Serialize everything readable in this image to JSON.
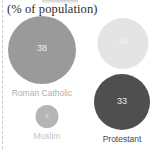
{
  "chart_data": {
    "type": "bar",
    "title": "",
    "subtitle": "(% of population)",
    "xlabel": "",
    "ylabel": "",
    "categories": [
      "Roman Catholic",
      "Other",
      "Protestant",
      "Muslim"
    ],
    "values": [
      38,
      24,
      33,
      5
    ],
    "value_labels": [
      "38",
      "24",
      "33",
      "5"
    ],
    "grid": false,
    "legend_position": "none",
    "annotations": [
      "(% of population)"
    ],
    "bubbles": [
      {
        "name": "roman-catholic",
        "label": "Roman Catholic",
        "value": 38,
        "value_text": "38",
        "color": "#9a9a9a",
        "label_color": "#b0b0b0",
        "value_color": "#efefef"
      },
      {
        "name": "other",
        "label": "Other",
        "value": 24,
        "value_text": "24",
        "color": "#e4e4e4",
        "label_color": "#d9d9d9",
        "value_color": "#f4f4f4"
      },
      {
        "name": "protestant",
        "label": "Protestant",
        "value": 33,
        "value_text": "33",
        "color": "#4f4f4f",
        "label_color": "#4a4a4a",
        "value_color": "#e8e8e8"
      },
      {
        "name": "muslim",
        "label": "Muslim",
        "value": 5,
        "value_text": "5",
        "color": "#b5b5b5",
        "label_color": "#c4c4c4",
        "value_color": "#e0e0e0"
      }
    ]
  },
  "chart": {
    "subtitle": "(% of population)"
  }
}
